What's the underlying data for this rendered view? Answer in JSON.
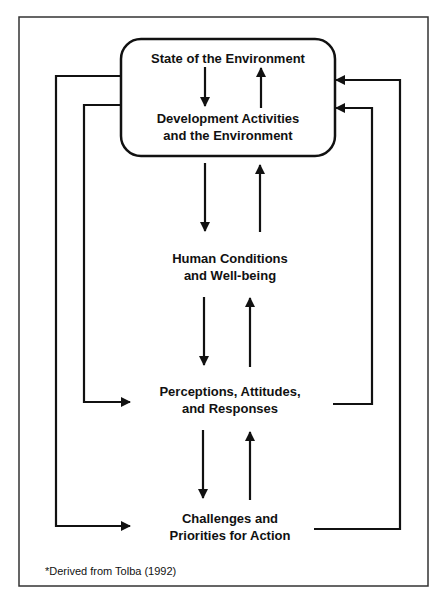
{
  "diagram": {
    "type": "flow",
    "colors": {
      "line": "#111111",
      "frame": "#333333",
      "background": "#ffffff"
    },
    "nodes": [
      {
        "id": "state",
        "label": "State of the Environment"
      },
      {
        "id": "development",
        "label_line1": "Development Activities",
        "label_line2": "and the Environment"
      },
      {
        "id": "human",
        "label_line1": "Human Conditions",
        "label_line2": "and Well-being"
      },
      {
        "id": "perceptions",
        "label_line1": "Perceptions, Attitudes,",
        "label_line2": "and Responses"
      },
      {
        "id": "challenges",
        "label_line1": "Challenges and",
        "label_line2": "Priorities for Action"
      }
    ],
    "edges": [
      {
        "from": "state",
        "to": "development",
        "direction": "down"
      },
      {
        "from": "development",
        "to": "state",
        "direction": "up"
      },
      {
        "from": "development",
        "to": "human",
        "direction": "down"
      },
      {
        "from": "human",
        "to": "development",
        "direction": "up"
      },
      {
        "from": "human",
        "to": "perceptions",
        "direction": "down"
      },
      {
        "from": "perceptions",
        "to": "human",
        "direction": "up"
      },
      {
        "from": "perceptions",
        "to": "challenges",
        "direction": "down"
      },
      {
        "from": "challenges",
        "to": "perceptions",
        "direction": "up"
      },
      {
        "from": "environment-box",
        "to": "perceptions",
        "route": "left-inner"
      },
      {
        "from": "environment-box",
        "to": "challenges",
        "route": "left-outer"
      },
      {
        "from": "perceptions",
        "to": "environment-box",
        "route": "right-inner"
      },
      {
        "from": "challenges",
        "to": "environment-box",
        "route": "right-outer"
      }
    ],
    "footnote": "*Derived from Tolba (1992)"
  }
}
